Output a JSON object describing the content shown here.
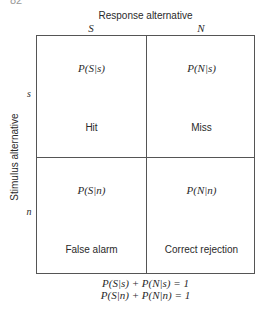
{
  "page_number": "82",
  "response_axis": {
    "title": "Response alternative",
    "columns": [
      "S",
      "N"
    ]
  },
  "stimulus_axis": {
    "title": "Stimulus alternative",
    "rows": [
      "s",
      "n"
    ]
  },
  "cells": [
    {
      "prob": "P(S|s)",
      "name": "Hit"
    },
    {
      "prob": "P(N|s)",
      "name": "Miss"
    },
    {
      "prob": "P(S|n)",
      "name": "False alarm"
    },
    {
      "prob": "P(N|n)",
      "name": "Correct rejection"
    }
  ],
  "equations": [
    "P(S|s) + P(N|s) = 1",
    "P(S|n) + P(N|n) = 1"
  ]
}
